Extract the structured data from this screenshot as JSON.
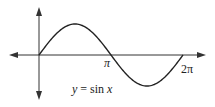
{
  "chart_data": {
    "type": "line",
    "title": "",
    "function_label": "y = sin x",
    "xlabel": "",
    "ylabel": "",
    "xlim": [
      0,
      6.2832
    ],
    "ylim": [
      -1,
      1
    ],
    "x_ticks": [
      {
        "value": 3.1416,
        "label": "π"
      },
      {
        "value": 6.2832,
        "label": "2π"
      }
    ],
    "grid": false,
    "legend": null,
    "series": [
      {
        "name": "y = sin x",
        "x": [
          0,
          0.7854,
          1.5708,
          2.3562,
          3.1416,
          3.927,
          4.7124,
          5.4978,
          6.2832
        ],
        "values": [
          0,
          0.7071,
          1,
          0.7071,
          0,
          -0.7071,
          -1,
          -0.7071,
          0
        ]
      }
    ]
  },
  "labels": {
    "pi": "π",
    "two_pi": "2π",
    "equation_y": "y",
    "equation_eq": " = sin ",
    "equation_x": "x"
  },
  "colors": {
    "axis": "#333333",
    "curve": "#222222",
    "text": "#222222"
  }
}
